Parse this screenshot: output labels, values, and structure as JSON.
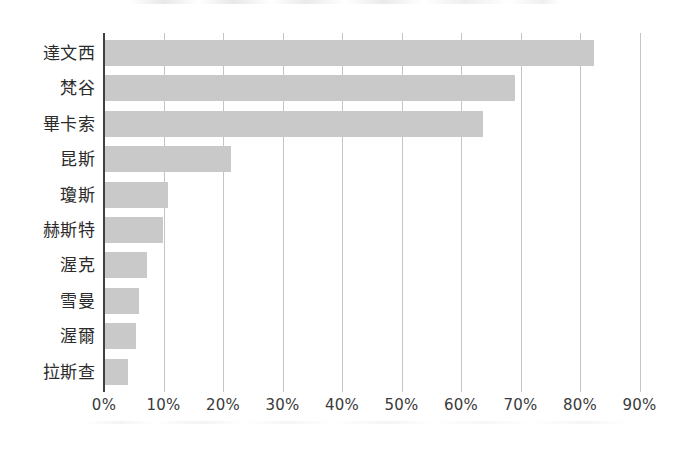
{
  "chart_data": {
    "type": "bar",
    "orientation": "horizontal",
    "title": "",
    "subtitle": "",
    "xlabel": "",
    "ylabel": "",
    "categories": [
      "達文西",
      "梵谷",
      "畢卡索",
      "昆斯",
      "瓊斯",
      "赫斯特",
      "渥克",
      "雪曼",
      "渥爾",
      "拉斯查"
    ],
    "values": [
      82.4,
      69.0,
      63.7,
      21.3,
      10.7,
      9.9,
      7.2,
      5.9,
      5.4,
      4.1
    ],
    "value_unit": "%",
    "xlim": [
      0,
      90
    ],
    "x_tick_values": [
      0,
      10,
      20,
      30,
      40,
      50,
      60,
      70,
      80,
      90
    ],
    "x_tick_labels": [
      "0%",
      "10%",
      "20%",
      "30%",
      "40%",
      "50%",
      "60%",
      "70%",
      "80%",
      "90%"
    ],
    "grid": "vertical",
    "legend": "none",
    "bar_color": "#c9c9c9",
    "gridline_color": "#c4c4c4",
    "axis_color": "#404040",
    "label_color": "#2b2b2b",
    "background_color": "#ffffff"
  }
}
